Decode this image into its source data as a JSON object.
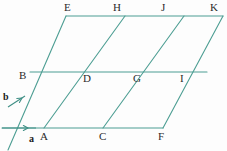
{
  "figure": {
    "kind": "vector-lattice-parallelogram-grid",
    "background_color": "#fdfdfd",
    "line_color": "#4d9e93",
    "vector_color": "#3f8f85",
    "label_color": "#2b2b2b",
    "vector_label_color": "#1a1a1a",
    "line_width": 1.1,
    "width": 227,
    "height": 151
  },
  "geometry": {
    "origin": {
      "x": 14,
      "y": 128
    },
    "vector_a": {
      "dx": 59,
      "dy": 0
    },
    "vector_b": {
      "dx": 16,
      "dy": -56
    },
    "columns": 4,
    "rows": 2
  },
  "vectors": [
    {
      "name": "a",
      "label": "a",
      "label_x": 29,
      "label_y": 134,
      "x1": 2,
      "y1": 128,
      "x2": 36,
      "y2": 128,
      "arrow_x": 28,
      "arrow_y": 128,
      "description": "horizontal basis vector pointing right"
    },
    {
      "name": "b",
      "label": "b",
      "label_x": 3,
      "label_y": 92,
      "x1": 8,
      "y1": 107,
      "x2": 25,
      "y2": 96,
      "arrow_x": 22,
      "arrow_y": 98,
      "description": "oblique basis vector pointing up and to the right"
    }
  ],
  "vertices": [
    {
      "id": "A",
      "label": "A",
      "x": 44,
      "y": 128,
      "label_x": 40,
      "label_y": 131,
      "row": "bottom"
    },
    {
      "id": "C",
      "label": "C",
      "x": 103,
      "y": 128,
      "label_x": 99,
      "label_y": 131,
      "row": "bottom"
    },
    {
      "id": "F",
      "label": "F",
      "x": 163,
      "y": 128,
      "label_x": 158,
      "label_y": 131,
      "row": "bottom"
    },
    {
      "id": "B",
      "label": "B",
      "x": 30,
      "y": 72,
      "label_x": 19,
      "label_y": 70,
      "row": "middle"
    },
    {
      "id": "D",
      "label": "D",
      "x": 89,
      "y": 72,
      "label_x": 83,
      "label_y": 73,
      "row": "middle"
    },
    {
      "id": "G",
      "label": "G",
      "x": 148,
      "y": 72,
      "label_x": 133,
      "label_y": 73,
      "row": "middle"
    },
    {
      "id": "I",
      "label": "I",
      "x": 207,
      "y": 72,
      "label_x": 180,
      "label_y": 73,
      "row": "middle"
    },
    {
      "id": "E",
      "label": "E",
      "x": 66,
      "y": 16,
      "label_x": 64,
      "label_y": 2,
      "row": "top"
    },
    {
      "id": "H",
      "label": "H",
      "x": 125,
      "y": 16,
      "label_x": 113,
      "label_y": 2,
      "row": "top"
    },
    {
      "id": "J",
      "label": "J",
      "x": 184,
      "y": 16,
      "label_x": 161,
      "label_y": 2,
      "row": "top"
    },
    {
      "id": "K",
      "label": "K",
      "x": 215,
      "y": 16,
      "label_x": 210,
      "label_y": 2,
      "row": "top"
    }
  ],
  "lines": {
    "horizontals": [
      {
        "name": "bottom-edge",
        "x1": 2,
        "y1": 128,
        "x2": 163,
        "y2": 128
      },
      {
        "name": "middle-edge",
        "x1": 30,
        "y1": 72,
        "x2": 207,
        "y2": 72
      },
      {
        "name": "top-edge",
        "x1": 66,
        "y1": 16,
        "x2": 223,
        "y2": 16
      }
    ],
    "diagonals": [
      {
        "name": "diagonal-0",
        "x1": 8,
        "y1": 150,
        "x2": 66,
        "y2": 16
      },
      {
        "name": "diagonal-1",
        "x1": 44,
        "y1": 128,
        "x2": 125,
        "y2": 16
      },
      {
        "name": "diagonal-2",
        "x1": 103,
        "y1": 128,
        "x2": 184,
        "y2": 16
      },
      {
        "name": "diagonal-3",
        "x1": 163,
        "y1": 128,
        "x2": 223,
        "y2": 16
      }
    ]
  }
}
